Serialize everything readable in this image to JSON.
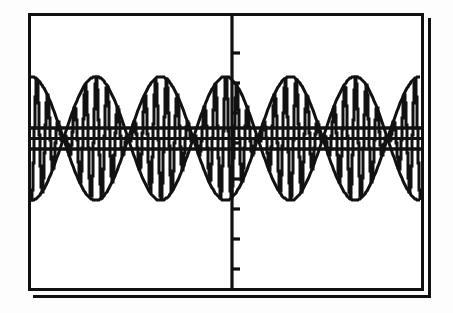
{
  "screen": {
    "device": "graphing-calculator",
    "background_color": "#ffffff",
    "ink_color": "#111111",
    "frame": {
      "style": "double-line-bezel",
      "x": 28,
      "y": 13,
      "width": 396,
      "height": 278,
      "border_width": 3,
      "shadow_offset": 5
    }
  },
  "axes": {
    "y_axis": {
      "x_px": 232,
      "label": "",
      "visible": true
    },
    "x_axis": {
      "y_px": 145,
      "label": "",
      "visible": true
    },
    "tick_length_px": 7,
    "y_ticks_above": 4,
    "y_ticks_below": 4,
    "y_tick_spacing_px": 30,
    "x_ticks_visible": false,
    "grid": "off"
  },
  "chart_data": {
    "type": "line",
    "title": "",
    "subtitle": "",
    "xlabel": "",
    "ylabel": "",
    "xlim": [
      -4.712389,
      4.712389
    ],
    "ylim": [
      -1.6,
      1.6
    ],
    "grid": false,
    "legend": "none",
    "annotations": [],
    "series": [
      {
        "name": "carrier",
        "expression": "Y1 = cos(24X)*cos(2X)",
        "style": "solid",
        "color": "#111111",
        "sample_count": 396,
        "carrier_frequency": 24,
        "envelope_frequency": 2,
        "amplitude": 1.0
      },
      {
        "name": "envelope-upper",
        "expression": "Y2 = cos(2X)",
        "style": "solid",
        "color": "#111111",
        "amplitude": 1.0
      },
      {
        "name": "envelope-lower",
        "expression": "Y3 = -cos(2X)",
        "style": "solid",
        "color": "#111111",
        "amplitude": 1.0
      }
    ],
    "envelope_lobes": [
      {
        "index": 1,
        "peak_x_px": 80,
        "peak_y_px": 93,
        "trough_y_px": 186,
        "peak_value": 1.0,
        "trough_value": -1.0
      },
      {
        "index": 2,
        "peak_x_px": 176,
        "peak_y_px": 93,
        "trough_y_px": 186,
        "peak_value": 1.0,
        "trough_value": -1.0
      },
      {
        "index": 3,
        "peak_x_px": 276,
        "peak_y_px": 93,
        "trough_y_px": 186,
        "peak_value": 1.0,
        "trough_value": -1.0
      },
      {
        "index": 4,
        "peak_x_px": 372,
        "peak_y_px": 93,
        "trough_y_px": 186,
        "peak_value": 1.0,
        "trough_value": -1.0
      }
    ],
    "dense_band": {
      "upper_y_px": 124,
      "lower_y_px": 146,
      "upper_value": 0.28,
      "lower_value": -0.28,
      "note": "solid aliased carrier region"
    },
    "x": [
      -4.71,
      -4.41,
      -4.12,
      -3.83,
      -3.53,
      -3.24,
      -2.95,
      -2.65,
      -2.36,
      -2.06,
      -1.77,
      -1.48,
      -1.18,
      -0.89,
      -0.59,
      -0.3,
      0.0,
      0.3,
      0.59,
      0.89,
      1.18,
      1.48,
      1.77,
      2.06,
      2.36,
      2.65,
      2.95,
      3.24,
      3.53,
      3.83,
      4.12,
      4.41,
      4.71
    ],
    "envelope_values": [
      0.0,
      0.31,
      0.59,
      0.81,
      0.95,
      1.0,
      0.95,
      0.81,
      0.59,
      0.31,
      0.0,
      -0.31,
      -0.59,
      -0.81,
      -0.95,
      -1.0,
      -0.95,
      -0.81,
      -0.59,
      -0.31,
      0.0,
      0.31,
      0.59,
      0.81,
      0.95,
      1.0,
      0.95,
      0.81,
      0.59,
      0.31,
      0.0,
      -0.31,
      -0.59
    ]
  },
  "accessibility": {
    "alt_text": "Graphing calculator screen showing a beat / amplitude-modulation waveform with four envelope lobes and a dense aliased carrier band along the x-axis."
  }
}
